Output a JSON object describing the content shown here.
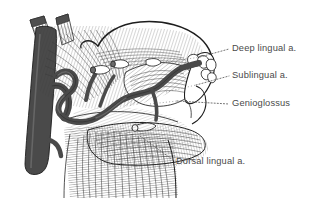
{
  "figure": {
    "kind": "anatomical-line-illustration",
    "background_color": "#ffffff",
    "ink_color": "#1d1d1d",
    "vessel_color": "#4a4a4a",
    "label_color": "#4a4a4a",
    "leader_style": "dotted",
    "width": 318,
    "height": 207
  },
  "labels": [
    {
      "id": "deep-lingual-artery",
      "text": "Deep lingual a.",
      "x": 232,
      "y": 49,
      "leader_from": [
        200,
        57
      ],
      "leader_to": [
        229,
        49
      ]
    },
    {
      "id": "sublingual-artery",
      "text": "Sublingual a.",
      "x": 232,
      "y": 76,
      "leader_from": [
        196,
        85
      ],
      "leader_to": [
        229,
        76
      ]
    },
    {
      "id": "genioglossus",
      "text": "Genioglossus",
      "x": 232,
      "y": 104,
      "leader_from": [
        177,
        101
      ],
      "leader_to": [
        229,
        104
      ]
    },
    {
      "id": "dorsal-lingual-artery",
      "text": "Dorsal lingual a.",
      "x": 176,
      "y": 162,
      "leader_from": [
        140,
        136
      ],
      "leader_to": [
        173,
        160
      ]
    }
  ],
  "structures": [
    {
      "id": "lingual-artery-trunk",
      "name": "Lingual artery trunk",
      "shade": "#4a4a4a"
    },
    {
      "id": "external-carotid",
      "name": "External carotid artery",
      "shade": "#4a4a4a"
    },
    {
      "id": "tongue-dorsum",
      "name": "Dorsum of tongue",
      "shade": "#ffffff"
    },
    {
      "id": "mandible-teeth",
      "name": "Mandible and incisor teeth",
      "shade": "#ffffff"
    },
    {
      "id": "hyoglossus",
      "name": "Hyoglossus muscle",
      "shade": "#ffffff"
    },
    {
      "id": "genioglossus-muscle",
      "name": "Genioglossus muscle",
      "shade": "#ffffff"
    },
    {
      "id": "geniohyoid",
      "name": "Geniohyoid muscle",
      "shade": "#ffffff"
    },
    {
      "id": "cut-muscle-stumps",
      "name": "Cut muscle stumps",
      "shade": "#4a4a4a"
    }
  ]
}
